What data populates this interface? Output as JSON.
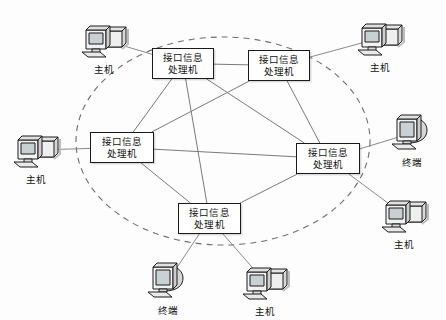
{
  "diagram": {
    "title": "",
    "background_color": "#fdfdfd",
    "line_color": "#6b6b6b",
    "node_border_color": "#1a1a1a",
    "boundary": {
      "name": "communication-subnet-boundary",
      "style": "dashed-ellipse",
      "cx": 223,
      "cy": 141,
      "rx": 147,
      "ry": 104
    },
    "imp_label_line1": "接口信息",
    "imp_label_line2": "处理机",
    "nodes": [
      {
        "id": "imp-top-left",
        "label_line1": "接口信息",
        "label_line2": "处理机",
        "x": 152,
        "y": 48,
        "w": 62,
        "h": 31
      },
      {
        "id": "imp-top-right",
        "label_line1": "接口信息",
        "label_line2": "处理机",
        "x": 248,
        "y": 50,
        "w": 62,
        "h": 31
      },
      {
        "id": "imp-left",
        "label_line1": "接口信息",
        "label_line2": "处理机",
        "x": 90,
        "y": 132,
        "w": 64,
        "h": 31
      },
      {
        "id": "imp-right",
        "label_line1": "接口信息",
        "label_line2": "处理机",
        "x": 296,
        "y": 143,
        "w": 64,
        "h": 31
      },
      {
        "id": "imp-bottom",
        "label_line1": "接口信息",
        "label_line2": "处理机",
        "x": 178,
        "y": 203,
        "w": 63,
        "h": 31
      }
    ],
    "devices": [
      {
        "id": "host-top-left",
        "kind": "host",
        "label": "主机",
        "x": 104,
        "y": 40
      },
      {
        "id": "host-top-right",
        "kind": "host",
        "label": "主机",
        "x": 380,
        "y": 38
      },
      {
        "id": "host-left",
        "kind": "host",
        "label": "主机",
        "x": 36,
        "y": 150
      },
      {
        "id": "terminal-right",
        "kind": "terminal",
        "label": "终端",
        "x": 412,
        "y": 133
      },
      {
        "id": "host-bottom-right",
        "kind": "host",
        "label": "主机",
        "x": 404,
        "y": 215
      },
      {
        "id": "terminal-bottom",
        "kind": "terminal",
        "label": "终端",
        "x": 168,
        "y": 281
      },
      {
        "id": "host-bottom",
        "kind": "host",
        "label": "主机",
        "x": 265,
        "y": 282
      }
    ],
    "trunk_links": [
      [
        "imp-top-left",
        "imp-top-right"
      ],
      [
        "imp-top-left",
        "imp-left"
      ],
      [
        "imp-top-left",
        "imp-bottom"
      ],
      [
        "imp-top-left",
        "imp-right"
      ],
      [
        "imp-top-right",
        "imp-left"
      ],
      [
        "imp-top-right",
        "imp-right"
      ],
      [
        "imp-left",
        "imp-right"
      ],
      [
        "imp-left",
        "imp-bottom"
      ],
      [
        "imp-bottom",
        "imp-right"
      ]
    ],
    "access_links": [
      [
        "host-top-left",
        "imp-top-left"
      ],
      [
        "host-top-right",
        "imp-top-right"
      ],
      [
        "host-left",
        "imp-left"
      ],
      [
        "terminal-right",
        "imp-right"
      ],
      [
        "host-bottom-right",
        "imp-right"
      ],
      [
        "terminal-bottom",
        "imp-bottom"
      ],
      [
        "host-bottom",
        "imp-bottom"
      ]
    ]
  }
}
